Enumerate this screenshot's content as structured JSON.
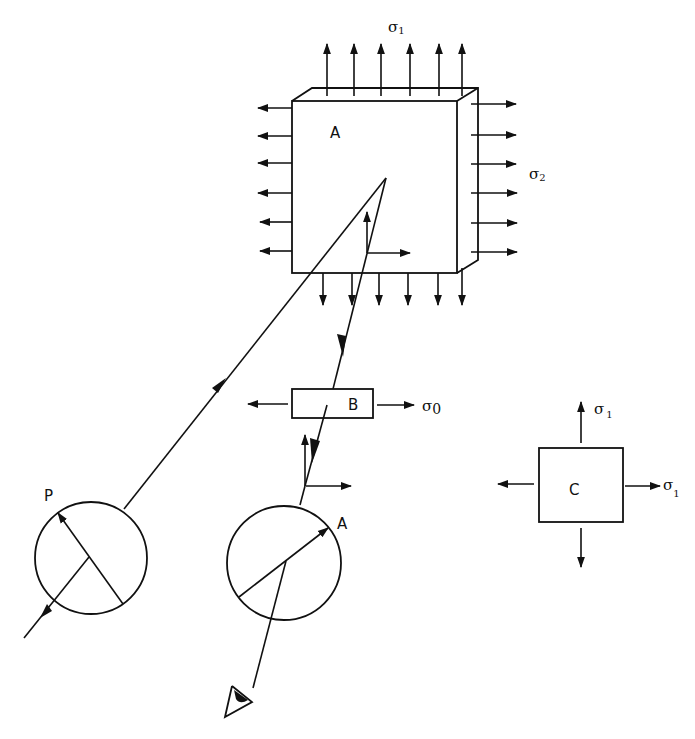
{
  "labels": {
    "plate_a": "A",
    "plate_b": "B",
    "plate_c": "C",
    "polarizer": "P",
    "analyzer": "A",
    "sigma_symbol": "σ",
    "sigma1_sub": "1",
    "sigma2_sub": "2",
    "sigma0_sub": "0"
  },
  "components": [
    {
      "id": "plate-a",
      "label": "A",
      "stresses": [
        "σ1 (vertical)",
        "σ2 (horizontal)"
      ]
    },
    {
      "id": "compensator-b",
      "label": "B",
      "stresses": [
        "σ0 (horizontal)"
      ]
    },
    {
      "id": "plate-c",
      "label": "C",
      "stresses": [
        "σ1 (vertical)",
        "σ1 (horizontal)"
      ]
    },
    {
      "id": "polarizer",
      "label": "P"
    },
    {
      "id": "analyzer",
      "label": "A"
    },
    {
      "id": "eye",
      "label": ""
    }
  ]
}
